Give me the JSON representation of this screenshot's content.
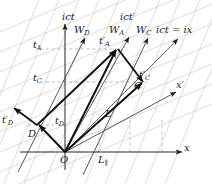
{
  "figure": {
    "type": "minkowski-spacetime-diagram",
    "background_color": "#ffffff",
    "ink_color": "#1a1a1a",
    "grid_color": "#b9b9b9",
    "dash_color": "#a0a0a0",
    "origin": {
      "x": 65,
      "y": 152
    }
  },
  "axes": {
    "vertical_label": "ict",
    "vertical_primed_label": "ict′",
    "horizontal_label": "x",
    "horizontal_primed_label": "x′",
    "light_cone_label": "ict = ix"
  },
  "worldlines": [
    {
      "name": "W",
      "sub": "D",
      "label": "W"
    },
    {
      "name": "W",
      "sub": "A",
      "label": "W"
    },
    {
      "name": "W",
      "sub": "C",
      "label": "W"
    }
  ],
  "labels": {
    "ict": {
      "text": "ict",
      "x": 62,
      "y": 18
    },
    "ict_prime": {
      "text": "ict",
      "prime": "′",
      "x": 122,
      "y": 18
    },
    "light_cone": {
      "text": "ict = ix",
      "x": 160,
      "y": 31
    },
    "x_axis": {
      "text": "x",
      "x": 185,
      "y": 148
    },
    "x_prime": {
      "text": "x",
      "prime": "′",
      "x": 177,
      "y": 85
    },
    "W_D": {
      "base": "W",
      "sub": "D",
      "x": 76,
      "y": 31
    },
    "W_A": {
      "base": "W",
      "sub": "A",
      "x": 111,
      "y": 31
    },
    "W_C": {
      "base": "W",
      "sub": "C",
      "x": 138,
      "y": 31
    },
    "t_A": {
      "base": "t",
      "sub": "A",
      "x": 34,
      "y": 44
    },
    "t_C": {
      "base": "t",
      "sub": "C",
      "x": 34,
      "y": 74
    },
    "t_D": {
      "base": "t",
      "sub": "D",
      "x": 57,
      "y": 120
    },
    "tp_A": {
      "base": "t",
      "prime": "′",
      "sub": "A",
      "x": 100,
      "y": 41
    },
    "tp_C": {
      "base": "t",
      "prime": "′",
      "sub": "C",
      "x": 140,
      "y": 74
    },
    "tp_D": {
      "base": "t",
      "prime": "′",
      "sub": "D",
      "x": 2,
      "y": 119
    },
    "D": {
      "text": "D",
      "x": 29,
      "y": 134
    },
    "C": {
      "text": "C",
      "x": 135,
      "y": 85
    },
    "O": {
      "text": "O",
      "x": 61,
      "y": 158
    },
    "L": {
      "text": "L",
      "x": 106,
      "y": 114
    },
    "L_parallel": {
      "base": "L",
      "sub": "∥",
      "x": 99,
      "y": 158
    }
  },
  "events": {
    "O": {
      "x": 65,
      "y": 152
    },
    "D": {
      "x": 37,
      "y": 125
    },
    "A": {
      "x": 117,
      "y": 49
    },
    "C": {
      "x": 143,
      "y": 82
    }
  }
}
